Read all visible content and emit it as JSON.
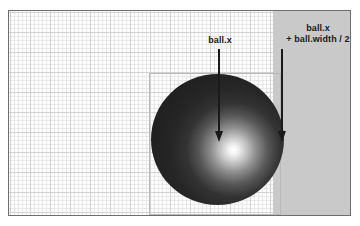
{
  "figure": {
    "type": "annotated-diagram",
    "background_color": "#fdfdfd",
    "frame_border_color": "#6e6e6e"
  },
  "grid": {
    "fine_color": "#e8e8e8",
    "coarse_color": "#d2d2d2",
    "fine_spacing_px": 4,
    "coarse_spacing_px": 20
  },
  "regions": {
    "highlight_band": {
      "name": "right-highlight-band",
      "color": "#c9c9c9"
    },
    "bounding_box": {
      "name": "ball-bounding-box",
      "border_color": "#b9b9b9"
    }
  },
  "ball": {
    "name": "ball",
    "shape": "sphere",
    "highlight_color": "#ffffff",
    "shadow_color": "#1e1e1e"
  },
  "annotations": [
    {
      "id": "center",
      "label": "ball.x",
      "arrow_color": "#1a1a1a",
      "direction": "down"
    },
    {
      "id": "right-edge",
      "label_line1": "ball.x",
      "label_line2": "+ ball.width / 2",
      "arrow_color": "#1a1a1a",
      "direction": "down"
    }
  ]
}
